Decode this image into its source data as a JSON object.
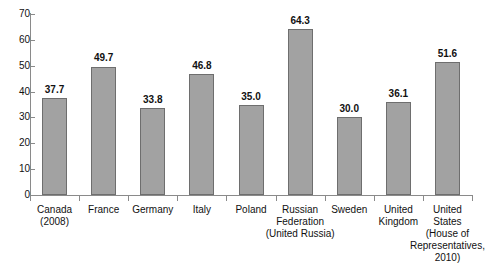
{
  "chart_data": {
    "type": "bar",
    "title": "",
    "subtitle": "",
    "xlabel": "",
    "ylabel": "",
    "ylim": [
      0,
      70
    ],
    "ytick_step": 10,
    "yticks": [
      "70",
      "60",
      "50",
      "40",
      "30",
      "20",
      "10",
      "0"
    ],
    "grid": false,
    "legend": "none",
    "categories": [
      "Canada (2008)",
      "France",
      "Germany",
      "Italy",
      "Poland",
      "Russian Federation (United Russia)",
      "Sweden",
      "United Kingdom",
      "United States (House of Representatives, 2010)"
    ],
    "category_lines": [
      [
        "Canada",
        "(2008)"
      ],
      [
        "France"
      ],
      [
        "Germany"
      ],
      [
        "Italy"
      ],
      [
        "Poland"
      ],
      [
        "Russian",
        "Federation",
        "(United Russia)"
      ],
      [
        "Sweden"
      ],
      [
        "United",
        "Kingdom"
      ],
      [
        "United",
        "States",
        "(House of",
        "Representatives,",
        "2010)"
      ]
    ],
    "values": [
      37.7,
      49.7,
      33.8,
      46.8,
      35.0,
      64.3,
      30.0,
      36.1,
      51.6
    ],
    "value_labels": [
      "37.7",
      "49.7",
      "33.8",
      "46.8",
      "35.0",
      "64.3",
      "30.0",
      "36.1",
      "51.6"
    ],
    "colors": {
      "bar_fill": "#a2a2a2",
      "bar_stroke": "#6e6e6e",
      "axis": "#8a8a8a",
      "text": "#111111",
      "background": "#ffffff"
    }
  }
}
